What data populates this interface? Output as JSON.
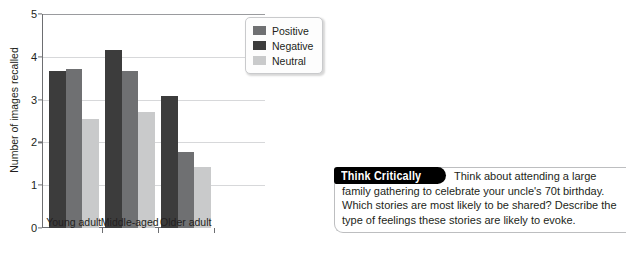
{
  "chart_data": {
    "type": "bar",
    "title": "",
    "xlabel": "",
    "ylabel": "Number of images recalled",
    "categories": [
      "Young adult",
      "Middle-aged",
      "Older adult"
    ],
    "series": [
      {
        "name": "Negative",
        "color": "#3c3c3c",
        "values": [
          3.67,
          4.15,
          3.08
        ]
      },
      {
        "name": "Positive",
        "color": "#6f7072",
        "values": [
          3.72,
          3.68,
          1.78
        ]
      },
      {
        "name": "Neutral",
        "color": "#c9cacb",
        "values": [
          2.54,
          2.7,
          1.42
        ]
      }
    ],
    "legend": [
      {
        "label": "Positive",
        "color": "#6f7072"
      },
      {
        "label": "Negative",
        "color": "#3c3c3c"
      },
      {
        "label": "Neutral",
        "color": "#c9cacb"
      }
    ],
    "ylim": [
      0,
      5
    ],
    "yticks": [
      "0",
      "1",
      "2",
      "3",
      "4",
      "5"
    ],
    "grid": true,
    "legend_position": "top-right"
  },
  "callout": {
    "badge": "Think Critically",
    "text": "Think about attending a large family gathering to celebrate your uncle's 70t birthday. Which stories are most likely to be shared? Describe the type of feelings these stories are likely to evoke."
  },
  "crop_remnant": {
    "text": ""
  }
}
